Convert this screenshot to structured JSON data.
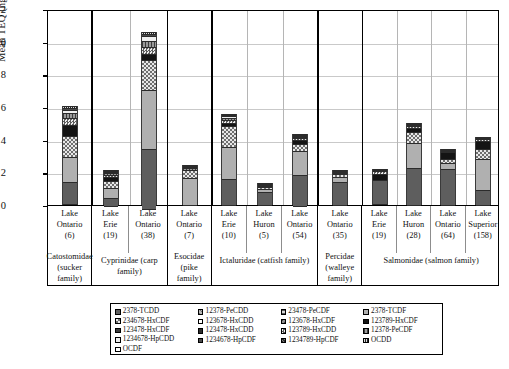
{
  "chart_data": {
    "type": "bar",
    "stacked": true,
    "title": "",
    "xlabel": "",
    "ylabel": "Mean TEQ (ng/kg ww)",
    "ylim": [
      0,
      12
    ],
    "yticks": [
      0,
      2,
      4,
      6,
      8,
      10,
      12
    ],
    "grid": true,
    "legend_position": "bottom",
    "categories": [
      "Lake Ontario (6)",
      "Lake Erie (19)",
      "Lake Ontario (38)",
      "Lake Ontario (7)",
      "Lake Erie (10)",
      "Lake Huron (5)",
      "Lake Ontario (54)",
      "Lake Ontario (35)",
      "Lake Erie (19)",
      "Lake Huron (28)",
      "Lake Ontario (64)",
      "Lake Superior (158)"
    ],
    "totals": [
      6.05,
      2.15,
      10.6,
      2.45,
      5.6,
      1.35,
      4.35,
      2.15,
      2.2,
      5.05,
      3.45,
      4.15
    ],
    "series": [
      {
        "name": "2378-TCDD",
        "values": [
          1.4,
          0.55,
          3.7,
          0.0,
          1.65,
          0.85,
          1.95,
          1.5,
          1.55,
          2.3,
          2.25,
          0.95
        ]
      },
      {
        "name": "12378-PeCDD",
        "values": [
          0.0,
          0.0,
          0.0,
          0.0,
          0.0,
          0.0,
          0.0,
          0.0,
          0.0,
          0.0,
          0.0,
          0.0
        ]
      },
      {
        "name": "23478-PeCDF",
        "values": [
          0.0,
          0.0,
          0.0,
          0.0,
          0.0,
          0.0,
          0.0,
          0.0,
          0.0,
          0.0,
          0.0,
          0.0
        ]
      },
      {
        "name": "2378-TCDF",
        "values": [
          1.55,
          0.6,
          3.65,
          1.75,
          1.95,
          0.18,
          1.45,
          0.32,
          0.0,
          1.55,
          0.35,
          1.9
        ]
      },
      {
        "name": "234678-HxCDF",
        "values": [
          1.25,
          0.45,
          1.8,
          0.45,
          1.25,
          0.12,
          0.45,
          0.15,
          0.0,
          0.65,
          0.25,
          0.6
        ]
      },
      {
        "name": "123678-HxCDD",
        "values": [
          0.0,
          0.0,
          0.0,
          0.0,
          0.0,
          0.0,
          0.0,
          0.0,
          0.0,
          0.0,
          0.0,
          0.0
        ]
      },
      {
        "name": "123678-HxCDF",
        "values": [
          0.0,
          0.0,
          0.0,
          0.0,
          0.0,
          0.0,
          0.0,
          0.0,
          0.0,
          0.0,
          0.0,
          0.0
        ]
      },
      {
        "name": "123789-HxCDF",
        "values": [
          0.7,
          0.22,
          0.4,
          0.0,
          0.22,
          0.08,
          0.22,
          0.08,
          0.4,
          0.25,
          0.45,
          0.55
        ]
      },
      {
        "name": "123478-HxCDF",
        "values": [
          0.0,
          0.0,
          0.0,
          0.0,
          0.0,
          0.0,
          0.0,
          0.0,
          0.0,
          0.0,
          0.0,
          0.0
        ]
      },
      {
        "name": "123478-HxCDD",
        "values": [
          0.0,
          0.0,
          0.0,
          0.0,
          0.0,
          0.0,
          0.0,
          0.0,
          0.0,
          0.0,
          0.0,
          0.0
        ]
      },
      {
        "name": "123789-HxCDD",
        "values": [
          0.45,
          0.15,
          0.42,
          0.0,
          0.18,
          0.06,
          0.12,
          0.05,
          0.15,
          0.15,
          0.08,
          0.08
        ]
      },
      {
        "name": "12378-PeCDF",
        "values": [
          0.28,
          0.1,
          0.35,
          0.12,
          0.15,
          0.04,
          0.08,
          0.03,
          0.06,
          0.08,
          0.05,
          0.05
        ]
      },
      {
        "name": "1234678-HpCDD",
        "values": [
          0.2,
          0.05,
          0.3,
          0.08,
          0.12,
          0.02,
          0.05,
          0.02,
          0.04,
          0.05,
          0.03,
          0.02
        ]
      },
      {
        "name": "1234678-HpCDF",
        "values": [
          0.1,
          0.02,
          0.12,
          0.03,
          0.05,
          0.0,
          0.02,
          0.0,
          0.0,
          0.02,
          0.0,
          0.0
        ]
      },
      {
        "name": "1234789-HpCDF",
        "values": [
          0.0,
          0.0,
          0.0,
          0.0,
          0.0,
          0.0,
          0.0,
          0.0,
          0.0,
          0.0,
          0.0,
          0.0
        ]
      },
      {
        "name": "OCDF",
        "values": [
          0.0,
          0.0,
          0.0,
          0.0,
          0.0,
          0.0,
          0.0,
          0.0,
          0.0,
          0.0,
          0.0,
          0.0
        ]
      },
      {
        "name": "OCDD",
        "values": [
          0.12,
          0.01,
          0.16,
          0.02,
          0.03,
          0.0,
          0.01,
          0.0,
          0.0,
          0.0,
          0.0,
          0.0
        ]
      }
    ]
  },
  "yaxis": {
    "title": "Mean TEQ (ng/kg ww)",
    "ticks": [
      "12",
      "10",
      "8",
      "6",
      "4",
      "2",
      "0"
    ]
  },
  "groups": [
    {
      "family": "Catostomidae (sucker family)",
      "sites": [
        {
          "lake": "Lake",
          "water": "Ontario",
          "n": "(6)"
        }
      ]
    },
    {
      "family": "Cyprinidae (carp family)",
      "sites": [
        {
          "lake": "Lake",
          "water": "Erie",
          "n": "(19)"
        },
        {
          "lake": "Lake",
          "water": "Ontario",
          "n": "(38)"
        }
      ]
    },
    {
      "family": "Esocidae (pike family)",
      "sites": [
        {
          "lake": "Lake",
          "water": "Ontario",
          "n": "(7)"
        }
      ]
    },
    {
      "family": "Ictaluridae (catfish family)",
      "sites": [
        {
          "lake": "Lake",
          "water": "Erie",
          "n": "(10)"
        },
        {
          "lake": "Lake",
          "water": "Huron",
          "n": "(5)"
        },
        {
          "lake": "Lake",
          "water": "Ontario",
          "n": "(54)"
        }
      ]
    },
    {
      "family": "Percidae (walleye family)",
      "sites": [
        {
          "lake": "Lake",
          "water": "Ontario",
          "n": "(35)"
        }
      ]
    },
    {
      "family": "Salmonidae (salmon family)",
      "sites": [
        {
          "lake": "Lake",
          "water": "Erie",
          "n": "(19)"
        },
        {
          "lake": "Lake",
          "water": "Huron",
          "n": "(28)"
        },
        {
          "lake": "Lake",
          "water": "Ontario",
          "n": "(64)"
        },
        {
          "lake": "Lake",
          "water": "Superior",
          "n": "(158)"
        }
      ]
    }
  ],
  "legend": {
    "columns": [
      [
        "2378-TCDD",
        "234678-HxCDF",
        "123478-HxCDF",
        "1234678-HpCDD",
        "OCDF"
      ],
      [
        "12378-PeCDD",
        "123678-HxCDD",
        "123478-HxCDD",
        "1234678-HpCDF"
      ],
      [
        "23478-PeCDF",
        "123678-HxCDF",
        "123789-HxCDD",
        "1234789-HpCDF"
      ],
      [
        "2378-TCDF",
        "123789-HxCDF",
        "12378-PeCDF",
        "OCDD"
      ]
    ]
  }
}
